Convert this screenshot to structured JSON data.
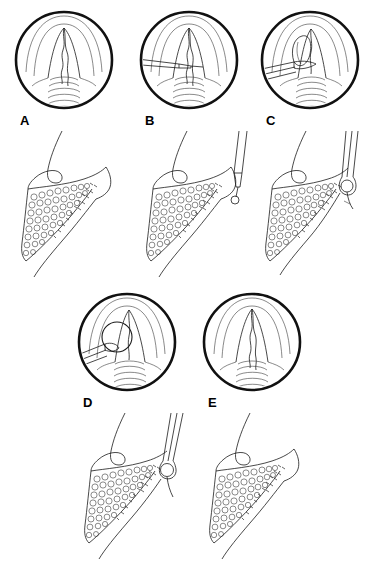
{
  "figure": {
    "type": "medical-illustration",
    "panel_count": 5,
    "row1_labels": [
      "A",
      "B",
      "C"
    ],
    "row2_labels": [
      "D",
      "E"
    ],
    "colors": {
      "background": "#ffffff",
      "outline": "#1a1a1a",
      "hairline": "#3a3a3a",
      "inset_border": "#111111",
      "tissue_fill": "#ffffff",
      "stipple": "#4a4a4a"
    }
  },
  "panels": [
    {
      "id": "A",
      "label": "A",
      "inset_caption": "laryngoscopic view: vocal cords and tracheal rings, cyst not yet engaged",
      "sagittal_caption": "sagittal view: epiglottis and tongue base with lingual tonsil tissue",
      "instrument": "none",
      "lesion_visible": false
    },
    {
      "id": "B",
      "label": "B",
      "inset_caption": "laryngoscopic view: instrument introduced from the left toward the vallecula",
      "sagittal_caption": "sagittal view: needle advanced from above into the vallecula",
      "instrument": "needle",
      "lesion_visible": false
    },
    {
      "id": "C",
      "label": "C",
      "inset_caption": "laryngoscopic view: cyst grasped and elevated by forceps",
      "sagittal_caption": "sagittal view: forceps engaging the vallecular cyst",
      "instrument": "forceps",
      "lesion_visible": true
    },
    {
      "id": "D",
      "label": "D",
      "inset_caption": "laryngoscopic view: round cyst retracted by forceps, base exposed",
      "sagittal_caption": "sagittal view: cyst held at the instrument tip for excision",
      "instrument": "forceps",
      "lesion_visible": true
    },
    {
      "id": "E",
      "label": "E",
      "inset_caption": "laryngoscopic view: larynx after complete excision, normal anatomy restored",
      "sagittal_caption": "sagittal view: vallecula after removal of the cyst",
      "instrument": "none",
      "lesion_visible": false
    }
  ]
}
